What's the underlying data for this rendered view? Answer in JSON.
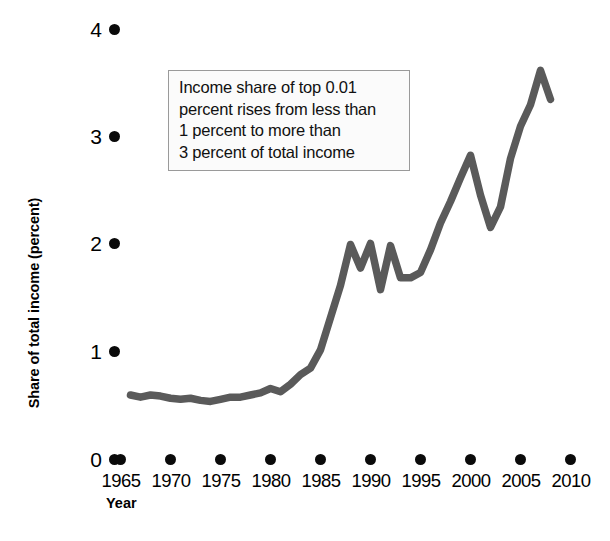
{
  "chart_data": {
    "type": "line",
    "title": "",
    "xlabel": "Year",
    "ylabel": "Share of total income (percent)",
    "xlim": [
      1965,
      2010
    ],
    "ylim": [
      0,
      4
    ],
    "grid": false,
    "legend": null,
    "x_ticks": [
      "1965",
      "1970",
      "1975",
      "1980",
      "1985",
      "1990",
      "1995",
      "2000",
      "2005",
      "2010"
    ],
    "y_ticks": [
      "0",
      "1",
      "2",
      "3",
      "4"
    ],
    "series_color": "#5a5a5a",
    "annotations": [
      {
        "name": "income-share-callout",
        "lines": [
          "Income share of top 0.01",
          "percent rises from less than",
          "1 percent to more than",
          "3 percent of total income"
        ]
      }
    ],
    "series": [
      {
        "name": "Income share of top 0.01 percent",
        "x": [
          1966,
          1967,
          1968,
          1969,
          1970,
          1971,
          1972,
          1973,
          1974,
          1975,
          1976,
          1977,
          1978,
          1979,
          1980,
          1981,
          1982,
          1983,
          1984,
          1985,
          1986,
          1987,
          1988,
          1989,
          1990,
          1991,
          1992,
          1993,
          1994,
          1995,
          1996,
          1997,
          1998,
          1999,
          2000,
          2001,
          2002,
          2003,
          2004,
          2005,
          2006,
          2007,
          2008
        ],
        "values": [
          0.6,
          0.58,
          0.6,
          0.59,
          0.57,
          0.56,
          0.57,
          0.55,
          0.54,
          0.56,
          0.58,
          0.58,
          0.6,
          0.62,
          0.66,
          0.63,
          0.7,
          0.79,
          0.85,
          1.02,
          1.32,
          1.62,
          2.0,
          1.78,
          2.01,
          1.58,
          1.99,
          1.69,
          1.69,
          1.74,
          1.95,
          2.2,
          2.4,
          2.62,
          2.83,
          2.46,
          2.16,
          2.35,
          2.8,
          3.1,
          3.3,
          3.62,
          3.35
        ]
      }
    ]
  },
  "axes": {
    "y_title": "Share of total income (percent)",
    "x_title": "Year"
  }
}
